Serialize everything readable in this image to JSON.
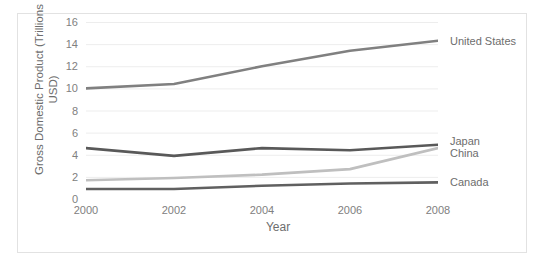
{
  "chart_data": {
    "type": "line",
    "title": "",
    "xlabel": "Year",
    "ylabel": "Gross Domestic Product (Trillions\nUSD)",
    "x": [
      2000,
      2002,
      2004,
      2006,
      2008
    ],
    "xticklabels": [
      "2000",
      "2002",
      "2004",
      "2006",
      "2008"
    ],
    "xlim": [
      2000,
      2008
    ],
    "ylim": [
      0,
      16
    ],
    "yticks": [
      0,
      2,
      4,
      6,
      8,
      10,
      12,
      14,
      16
    ],
    "yticklabels": [
      "0",
      "2",
      "4",
      "6",
      "8",
      "10",
      "12",
      "14",
      "16"
    ],
    "grid": "horizontal",
    "legend_position": "right-of-plot-at-series-end",
    "series": [
      {
        "name": "United States",
        "color": "#808080",
        "values": [
          10.0,
          10.4,
          12.0,
          13.4,
          14.3
        ]
      },
      {
        "name": "Japan",
        "color": "#595959",
        "values": [
          4.6,
          3.9,
          4.6,
          4.4,
          4.9
        ]
      },
      {
        "name": "China",
        "color": "#bfbfbf",
        "values": [
          1.7,
          1.9,
          2.2,
          2.7,
          4.6
        ]
      },
      {
        "name": "Canada",
        "color": "#606060",
        "values": [
          0.9,
          0.9,
          1.2,
          1.4,
          1.5
        ]
      }
    ]
  }
}
